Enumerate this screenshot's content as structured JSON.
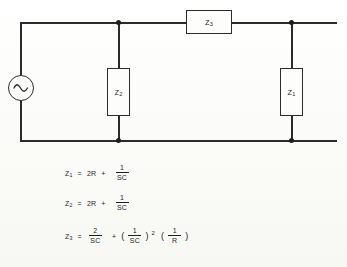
{
  "diagram": {
    "background_color": "#fbfbf9",
    "ink_color": "#2b2b2b"
  },
  "circuit": {
    "source": {
      "name": "AC voltage source",
      "symbol": "sine-wave"
    },
    "components": [
      {
        "id": "Z3",
        "label_base": "Z",
        "label_sub": "3",
        "orientation": "horizontal",
        "position": "top-rail"
      },
      {
        "id": "Z2",
        "label_base": "Z",
        "label_sub": "2",
        "orientation": "vertical",
        "position": "middle-shunt"
      },
      {
        "id": "Z1",
        "label_base": "Z",
        "label_sub": "1",
        "orientation": "vertical",
        "position": "right-shunt"
      }
    ],
    "nodes": [
      {
        "id": "n-top-mid",
        "x": 119,
        "y": 22
      },
      {
        "id": "n-bot-mid",
        "x": 119,
        "y": 140
      },
      {
        "id": "n-top-right",
        "x": 292,
        "y": 22
      },
      {
        "id": "n-bot-right",
        "x": 292,
        "y": 140
      }
    ]
  },
  "formulas": [
    {
      "id": "z1-equation",
      "lhs_base": "Z",
      "lhs_sub": "1",
      "equals": "=",
      "term1": "2R",
      "plus": "+",
      "frac_num": "1",
      "frac_den": "SC"
    },
    {
      "id": "z2-equation",
      "lhs_base": "Z",
      "lhs_sub": "2",
      "equals": "=",
      "term1": "2R",
      "plus": "+",
      "frac_num": "1",
      "frac_den": "SC"
    },
    {
      "id": "z3-equation",
      "lhs_base": "Z",
      "lhs_sub": "3",
      "equals": "=",
      "frac1_num": "2",
      "frac1_den": "SC",
      "plus": "+",
      "open_paren_a": "(",
      "frac2_num": "1",
      "frac2_den": "SC",
      "close_paren_a": ")",
      "exponent": "2",
      "open_paren_b": "(",
      "frac3_num": "1",
      "frac3_den": "R",
      "close_paren_b": ")"
    }
  ]
}
